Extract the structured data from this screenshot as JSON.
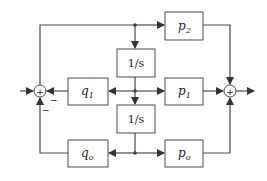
{
  "diagram": {
    "type": "block-diagram",
    "blocks": {
      "p2": {
        "base": "p",
        "sub": "2"
      },
      "integrator_top": {
        "label": "1/s"
      },
      "q1": {
        "base": "q",
        "sub": "1"
      },
      "p1": {
        "base": "p",
        "sub": "1"
      },
      "integrator_bottom": {
        "label": "1/s"
      },
      "qo": {
        "base": "q",
        "sub": "o"
      },
      "po": {
        "base": "p",
        "sub": "o"
      }
    },
    "summers": {
      "left": {
        "symbol": "+",
        "signs": {
          "right": "−",
          "bottom": "−"
        }
      },
      "right": {
        "symbol": "+"
      }
    }
  }
}
